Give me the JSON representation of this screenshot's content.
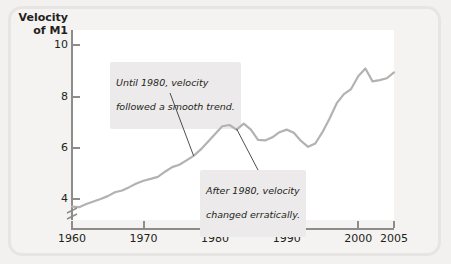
{
  "chart_data": {
    "type": "line",
    "title": "Velocity\nof M1",
    "title_line1": "Velocity",
    "title_line2": "of M1",
    "xlabel": "",
    "ylabel": "Velocity of M1",
    "xlim": [
      1960,
      2005
    ],
    "ylim": [
      3.2,
      10.6
    ],
    "y_ticks": [
      4,
      6,
      8,
      10
    ],
    "y_tick_labels": [
      "4",
      "6",
      "8",
      "10"
    ],
    "x_ticks": [
      1960,
      1970,
      1980,
      1990,
      2000,
      2005
    ],
    "x_tick_labels": [
      "1960",
      "1970",
      "1980",
      "1990",
      "2000",
      "2005"
    ],
    "grid": false,
    "legend": false,
    "axis_break": true,
    "line_color": "#b3b2b1",
    "series": [
      {
        "name": "Velocity of M1",
        "x": [
          1960,
          1961,
          1962,
          1963,
          1964,
          1965,
          1966,
          1967,
          1968,
          1969,
          1970,
          1971,
          1972,
          1973,
          1974,
          1975,
          1976,
          1977,
          1978,
          1979,
          1980,
          1981,
          1982,
          1983,
          1984,
          1985,
          1986,
          1987,
          1988,
          1989,
          1990,
          1991,
          1992,
          1993,
          1994,
          1995,
          1996,
          1997,
          1998,
          1999,
          2000,
          2001,
          2002,
          2003,
          2004,
          2005
        ],
        "values": [
          3.72,
          3.7,
          3.82,
          3.92,
          4.02,
          4.13,
          4.28,
          4.35,
          4.48,
          4.62,
          4.73,
          4.8,
          4.88,
          5.08,
          5.26,
          5.35,
          5.52,
          5.7,
          5.95,
          6.25,
          6.55,
          6.85,
          6.9,
          6.72,
          6.95,
          6.72,
          6.32,
          6.3,
          6.42,
          6.62,
          6.72,
          6.6,
          6.28,
          6.05,
          6.18,
          6.62,
          7.15,
          7.75,
          8.1,
          8.3,
          8.8,
          9.1,
          8.6,
          8.65,
          8.72,
          8.95
        ]
      }
    ],
    "annotations": [
      {
        "id": "callout-1",
        "text": "Until 1980, velocity\nfollowed a smooth trend.",
        "line1": "Until 1980, velocity",
        "line2": "followed a smooth trend.",
        "points_to_year": 1977,
        "points_to_value": 5.7
      },
      {
        "id": "callout-2",
        "text": "After 1980, velocity\nchanged erratically.",
        "line1": "After 1980, velocity",
        "line2": "changed erratically.",
        "points_to_year": 1983,
        "points_to_value": 6.75
      }
    ]
  },
  "colors": {
    "page_background": "#f2f1f0",
    "frame_border": "#e6e5e4",
    "plot_background": "#ffffff",
    "axis": "#8d8c8a",
    "line": "#b3b2b1",
    "text": "#231f20",
    "callout_background": "#eceaea"
  }
}
